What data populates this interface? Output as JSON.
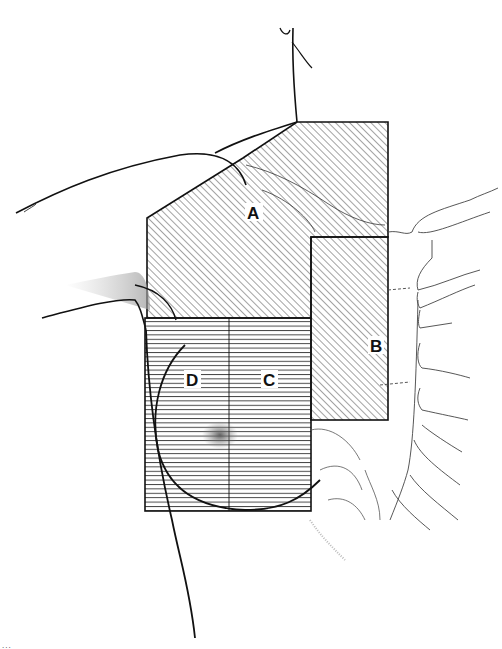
{
  "figure": {
    "type": "anatomical-diagram",
    "regions": [
      {
        "id": "A",
        "label": "A",
        "hatch": "diagonal",
        "description": "upper block over shoulder/axilla and upper chest"
      },
      {
        "id": "B",
        "label": "B",
        "hatch": "diagonal",
        "description": "medial vertical block over ribs/sternum edge"
      },
      {
        "id": "C",
        "label": "C",
        "hatch": "horizontal",
        "description": "medial half of lower rectangle over breast"
      },
      {
        "id": "D",
        "label": "D",
        "hatch": "horizontal",
        "description": "lateral half of lower rectangle over breast"
      }
    ],
    "colors": {
      "ink": "#111111",
      "background": "#ffffff",
      "hatch": "#333333",
      "rib_lines": "#555555"
    }
  },
  "caption": {
    "text": "..."
  }
}
